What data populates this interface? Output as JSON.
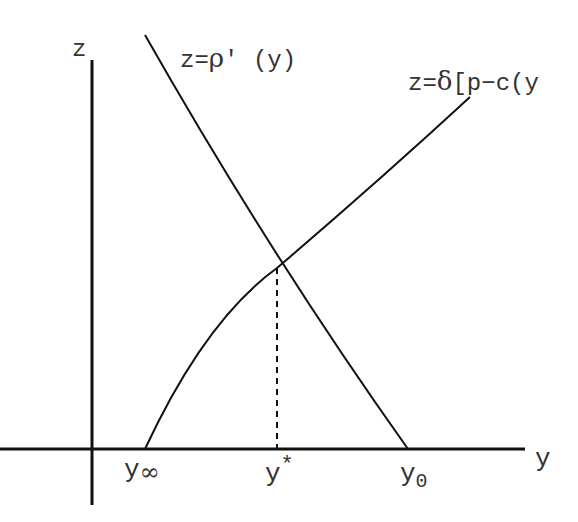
{
  "diagram": {
    "axes": {
      "x_label": "y",
      "y_label": "z"
    },
    "curves": [
      {
        "name": "marginal-cost",
        "label_prefix": "z=",
        "label_greek": "ρ",
        "label_suffix": "′ (y)"
      },
      {
        "name": "discounted-margin",
        "label_prefix": "z=",
        "label_greek": "δ",
        "label_suffix": "[p−c(y"
      }
    ],
    "ticks": [
      {
        "base": "y",
        "sub": "∞"
      },
      {
        "base": "y",
        "sup": "*"
      },
      {
        "base": "y",
        "sub": "0"
      }
    ],
    "colors": {
      "line": "#111111",
      "text": "#333333"
    }
  }
}
